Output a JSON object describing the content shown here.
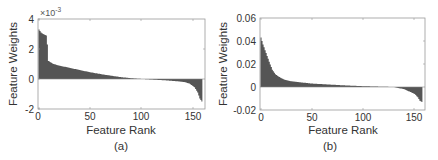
{
  "chart_data": [
    {
      "panel": "(a)",
      "type": "bar",
      "xlabel": "Feature Rank",
      "ylabel": "Feature Weights",
      "y_multiplier": "×10^-3",
      "xlim": [
        0,
        160
      ],
      "ylim": [
        -2,
        4
      ],
      "xticks": [
        0,
        50,
        100,
        150
      ],
      "yticks": [
        -2,
        0,
        2,
        4
      ],
      "grid": false,
      "n_features": 157,
      "description": "Sorted feature weights, descending",
      "key_points": [
        {
          "rank": 1,
          "value": 3.3
        },
        {
          "rank": 3,
          "value": 3.1
        },
        {
          "rank": 5,
          "value": 3.0
        },
        {
          "rank": 8,
          "value": 2.9
        },
        {
          "rank": 9,
          "value": 2.3
        },
        {
          "rank": 10,
          "value": 1.2
        },
        {
          "rank": 15,
          "value": 1.0
        },
        {
          "rank": 20,
          "value": 0.9
        },
        {
          "rank": 30,
          "value": 0.75
        },
        {
          "rank": 40,
          "value": 0.6
        },
        {
          "rank": 50,
          "value": 0.45
        },
        {
          "rank": 60,
          "value": 0.33
        },
        {
          "rank": 70,
          "value": 0.22
        },
        {
          "rank": 80,
          "value": 0.12
        },
        {
          "rank": 90,
          "value": 0.05
        },
        {
          "rank": 100,
          "value": 0.0
        },
        {
          "rank": 110,
          "value": -0.04
        },
        {
          "rank": 120,
          "value": -0.08
        },
        {
          "rank": 130,
          "value": -0.13
        },
        {
          "rank": 140,
          "value": -0.2
        },
        {
          "rank": 145,
          "value": -0.3
        },
        {
          "rank": 150,
          "value": -0.55
        },
        {
          "rank": 153,
          "value": -0.9
        },
        {
          "rank": 155,
          "value": -1.3
        },
        {
          "rank": 157,
          "value": -1.5
        }
      ]
    },
    {
      "panel": "(b)",
      "type": "bar",
      "xlabel": "Feature Rank",
      "ylabel": "Feature Weights",
      "xlim": [
        0,
        160
      ],
      "ylim": [
        -0.02,
        0.06
      ],
      "xticks": [
        0,
        50,
        100,
        150
      ],
      "yticks": [
        -0.02,
        0,
        0.02,
        0.04,
        0.06
      ],
      "grid": false,
      "n_features": 157,
      "description": "Sorted feature weights, descending",
      "key_points": [
        {
          "rank": 1,
          "value": 0.043
        },
        {
          "rank": 3,
          "value": 0.037
        },
        {
          "rank": 5,
          "value": 0.032
        },
        {
          "rank": 7,
          "value": 0.027
        },
        {
          "rank": 9,
          "value": 0.022
        },
        {
          "rank": 12,
          "value": 0.015
        },
        {
          "rank": 15,
          "value": 0.011
        },
        {
          "rank": 20,
          "value": 0.008
        },
        {
          "rank": 25,
          "value": 0.006
        },
        {
          "rank": 30,
          "value": 0.005
        },
        {
          "rank": 40,
          "value": 0.004
        },
        {
          "rank": 50,
          "value": 0.003
        },
        {
          "rank": 60,
          "value": 0.0025
        },
        {
          "rank": 80,
          "value": 0.0015
        },
        {
          "rank": 100,
          "value": 0.0007
        },
        {
          "rank": 120,
          "value": 0.0002
        },
        {
          "rank": 130,
          "value": 0.0
        },
        {
          "rank": 140,
          "value": -0.002
        },
        {
          "rank": 145,
          "value": -0.004
        },
        {
          "rank": 150,
          "value": -0.006
        },
        {
          "rank": 153,
          "value": -0.009
        },
        {
          "rank": 155,
          "value": -0.012
        },
        {
          "rank": 157,
          "value": -0.013
        }
      ]
    }
  ],
  "panels": {
    "a": {
      "caption": "(a)",
      "xlabel": "Feature Rank",
      "ylabel": "Feature Weights",
      "exponent_label": "×10",
      "exponent_power": "-3",
      "xtick_labels": [
        "0",
        "50",
        "100",
        "150"
      ],
      "ytick_labels": [
        "4",
        "2",
        "0",
        "-2"
      ]
    },
    "b": {
      "caption": "(b)",
      "xlabel": "Feature Rank",
      "ylabel": "Feature Weights",
      "xtick_labels": [
        "0",
        "50",
        "100",
        "150"
      ],
      "ytick_labels": [
        "0.06",
        "0.04",
        "0.02",
        "0",
        "-0.02"
      ]
    }
  },
  "colors": {
    "bar_fill": "#555555",
    "axis": "#888888",
    "text": "#333333"
  }
}
